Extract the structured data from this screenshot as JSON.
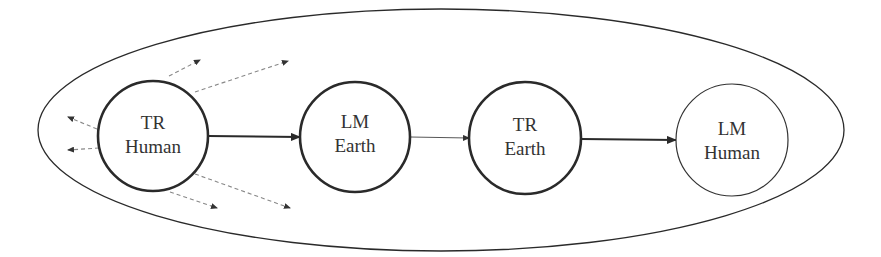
{
  "diagram": {
    "boundary": {
      "cx": 441,
      "cy": 130,
      "rx": 403,
      "ry": 121
    },
    "nodes": [
      {
        "id": "tr-human",
        "line1": "TR",
        "line2": "Human",
        "cx": 153,
        "cy": 136,
        "r": 55,
        "stroke_width": 2.6
      },
      {
        "id": "lm-earth",
        "line1": "LM",
        "line2": "Earth",
        "cx": 355,
        "cy": 137,
        "r": 55,
        "stroke_width": 2.6
      },
      {
        "id": "tr-earth",
        "line1": "TR",
        "line2": "Earth",
        "cx": 525,
        "cy": 138,
        "r": 56,
        "stroke_width": 2.6
      },
      {
        "id": "lm-human",
        "line1": "LM",
        "line2": "Human",
        "cx": 732,
        "cy": 140,
        "r": 56,
        "stroke_width": 1.2
      }
    ],
    "edges": [
      {
        "from": "tr-human",
        "to": "lm-earth",
        "weight": "thick"
      },
      {
        "from": "lm-earth",
        "to": "tr-earth",
        "weight": "thin"
      },
      {
        "from": "tr-earth",
        "to": "lm-human",
        "weight": "thick"
      }
    ],
    "dashed_outflows": 6,
    "colors": {
      "stroke": "#2a2a2a",
      "dashed": "#888888",
      "text": "#333333"
    }
  }
}
